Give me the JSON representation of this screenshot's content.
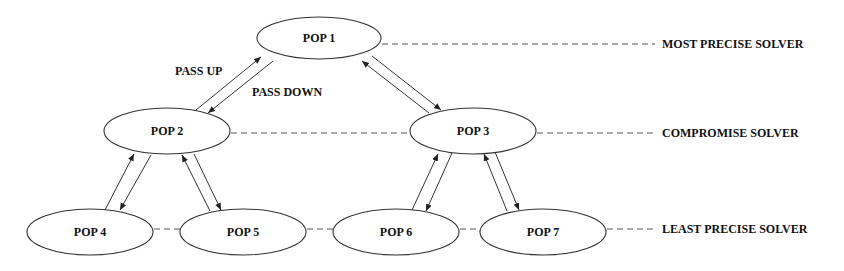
{
  "diagram": {
    "nodes": [
      {
        "id": "pop1",
        "label": "POP 1",
        "cx": 319,
        "cy": 38,
        "rx": 62,
        "ry": 21
      },
      {
        "id": "pop2",
        "label": "POP 2",
        "cx": 167,
        "cy": 131,
        "rx": 63,
        "ry": 23
      },
      {
        "id": "pop3",
        "label": "POP 3",
        "cx": 473,
        "cy": 131,
        "rx": 63,
        "ry": 23
      },
      {
        "id": "pop4",
        "label": "POP 4",
        "cx": 90,
        "cy": 232,
        "rx": 63,
        "ry": 23
      },
      {
        "id": "pop5",
        "label": "POP 5",
        "cx": 243,
        "cy": 232,
        "rx": 63,
        "ry": 23
      },
      {
        "id": "pop6",
        "label": "POP 6",
        "cx": 396,
        "cy": 232,
        "rx": 63,
        "ry": 23
      },
      {
        "id": "pop7",
        "label": "POP 7",
        "cx": 543,
        "cy": 232,
        "rx": 63,
        "ry": 23
      }
    ],
    "edges": [
      {
        "from": "pop2",
        "to": "pop1",
        "type": "bidirectional"
      },
      {
        "from": "pop1",
        "to": "pop3",
        "type": "bidirectional"
      },
      {
        "from": "pop4",
        "to": "pop2",
        "type": "bidirectional"
      },
      {
        "from": "pop2",
        "to": "pop5",
        "type": "bidirectional"
      },
      {
        "from": "pop6",
        "to": "pop3",
        "type": "bidirectional"
      },
      {
        "from": "pop3",
        "to": "pop7",
        "type": "bidirectional"
      }
    ],
    "edge_labels": {
      "pass_up": "PASS UP",
      "pass_down": "PASS DOWN"
    },
    "levels": [
      {
        "label": "MOST PRECISE SOLVER",
        "y": 44
      },
      {
        "label": "COMPROMISE SOLVER",
        "y": 133
      },
      {
        "label": "LEAST PRECISE SOLVER",
        "y": 229
      }
    ],
    "colors": {
      "stroke": "#333333",
      "background": "#ffffff",
      "text": "#111111"
    }
  }
}
